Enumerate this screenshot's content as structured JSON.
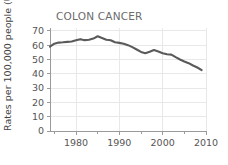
{
  "chart_data": {
    "type": "line",
    "title": "COLON CANCER",
    "xlabel": "",
    "ylabel": "Rates per 100,000 people (US)",
    "xlim": [
      1974,
      2010
    ],
    "ylim": [
      0,
      72
    ],
    "grid": true,
    "legend": null,
    "line_color": "#5a5a5a",
    "x_ticks_major": [
      1980,
      1990,
      2000,
      2010
    ],
    "x_ticks_minor": [
      1975,
      1985,
      1995,
      2005
    ],
    "x_tick_labels": [
      "1980",
      "1990",
      "2000",
      "2010"
    ],
    "y_ticks": [
      0,
      10,
      20,
      30,
      40,
      50,
      60,
      70
    ],
    "y_tick_labels": [
      "0",
      "10",
      "20",
      "30",
      "40",
      "50",
      "60",
      "70"
    ],
    "series": [
      {
        "name": "Colon cancer incidence rate",
        "x": [
          1974,
          1975,
          1976,
          1977,
          1978,
          1979,
          1980,
          1981,
          1982,
          1983,
          1984,
          1985,
          1986,
          1987,
          1988,
          1989,
          1990,
          1991,
          1992,
          1993,
          1994,
          1995,
          1996,
          1997,
          1998,
          1999,
          2000,
          2001,
          2002,
          2003,
          2004,
          2005,
          2006,
          2007,
          2008,
          2009
        ],
        "values": [
          59.0,
          61.0,
          61.8,
          62.0,
          62.3,
          62.6,
          63.4,
          64.2,
          63.5,
          63.8,
          64.6,
          66.2,
          65.0,
          63.8,
          63.4,
          62.0,
          61.6,
          61.0,
          60.0,
          58.6,
          57.0,
          55.3,
          54.4,
          55.4,
          56.6,
          55.6,
          54.4,
          53.6,
          53.4,
          51.6,
          50.0,
          48.6,
          47.4,
          45.8,
          44.4,
          42.6
        ]
      }
    ]
  },
  "axis": {
    "y_label_text": "Rates per 100,000 people (US)"
  }
}
